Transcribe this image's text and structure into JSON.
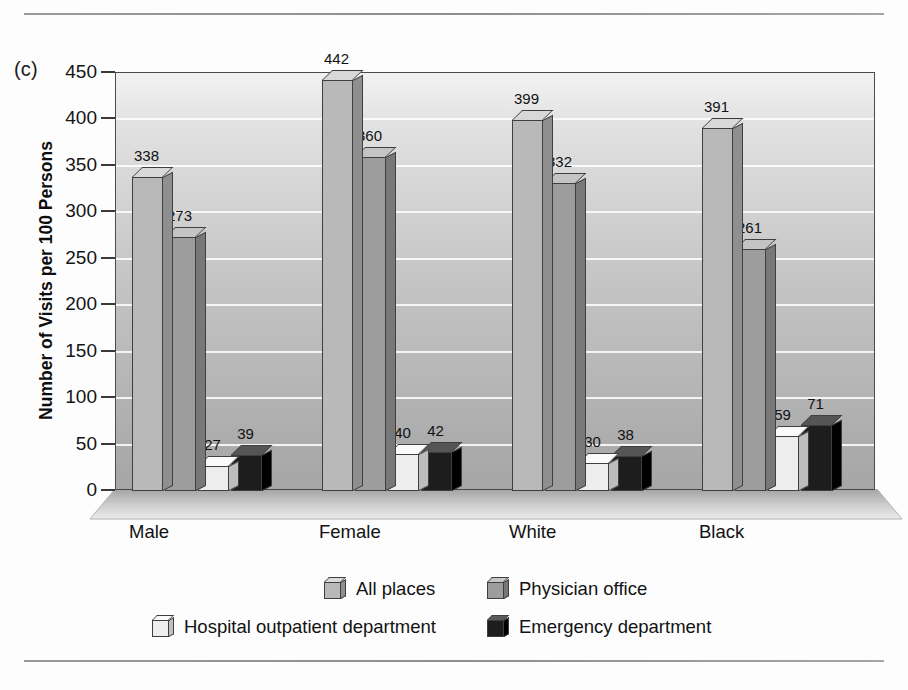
{
  "panel": {
    "label": "(c)"
  },
  "chart_data": {
    "type": "bar",
    "title": "",
    "xlabel": "",
    "ylabel": "Number of Visits per 100 Persons",
    "ylim": [
      0,
      450
    ],
    "ytick_step": 50,
    "yticks": [
      "450",
      "400",
      "350",
      "300",
      "250",
      "200",
      "150",
      "100",
      "50",
      "0"
    ],
    "grid": true,
    "legend_position": "bottom",
    "categories": [
      "Male",
      "Female",
      "White",
      "Black"
    ],
    "series": [
      {
        "name": "All places",
        "color": "#b9b9b9",
        "values": [
          338,
          442,
          399,
          391
        ]
      },
      {
        "name": "Physician office",
        "color": "#9d9d9d",
        "values": [
          273,
          360,
          332,
          261
        ]
      },
      {
        "name": "Hospital outpatient department",
        "color": "#ededed",
        "values": [
          27,
          40,
          30,
          59
        ]
      },
      {
        "name": "Emergency department",
        "color": "#1d1d1d",
        "values": [
          39,
          42,
          38,
          71
        ]
      }
    ]
  },
  "legend": {
    "items": [
      {
        "label": "All places"
      },
      {
        "label": "Physician office"
      },
      {
        "label": "Hospital outpatient department"
      },
      {
        "label": "Emergency department"
      }
    ]
  }
}
